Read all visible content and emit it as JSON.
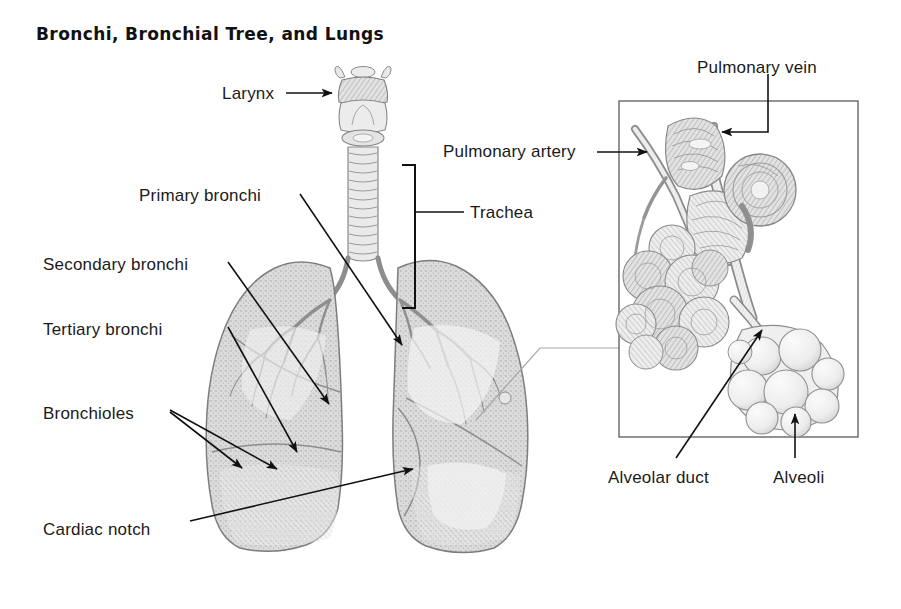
{
  "figure": {
    "title": "Bronchi, Bronchial Tree, and Lungs",
    "background_color": "#ffffff",
    "ink_color": "#1a1a1a",
    "tissue_fill": "#d9d9d9",
    "tissue_stroke": "#8a8a8a",
    "connector_color": "#9a9a9a"
  },
  "labels": {
    "larynx": "Larynx",
    "primary_bronchi": "Primary bronchi",
    "secondary_bronchi": "Secondary bronchi",
    "tertiary_bronchi": "Tertiary bronchi",
    "bronchioles": "Bronchioles",
    "cardiac_notch": "Cardiac notch",
    "trachea": "Trachea",
    "pulmonary_vein": "Pulmonary vein",
    "pulmonary_artery": "Pulmonary artery",
    "alveolar_duct": "Alveolar duct",
    "alveoli": "Alveoli"
  },
  "label_positions": {
    "larynx": {
      "x": 222,
      "y": 84
    },
    "primary_bronchi": {
      "x": 139,
      "y": 186
    },
    "secondary_bronchi": {
      "x": 43,
      "y": 255
    },
    "tertiary_bronchi": {
      "x": 43,
      "y": 320
    },
    "bronchioles": {
      "x": 43,
      "y": 404
    },
    "cardiac_notch": {
      "x": 43,
      "y": 520
    },
    "trachea": {
      "x": 470,
      "y": 203
    },
    "pulmonary_vein": {
      "x": 697,
      "y": 58
    },
    "pulmonary_artery": {
      "x": 443,
      "y": 142
    },
    "alveolar_duct": {
      "x": 608,
      "y": 468
    },
    "alveoli": {
      "x": 773,
      "y": 468
    }
  },
  "inset_box": {
    "x": 619,
    "y": 101,
    "width": 239,
    "height": 336
  },
  "anatomy_parts": [
    "larynx",
    "trachea",
    "right-lung",
    "left-lung",
    "bronchial-tree",
    "alveolar-sac-cluster",
    "pulmonary-vessels"
  ]
}
